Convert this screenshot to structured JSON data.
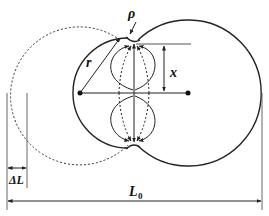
{
  "diagram": {
    "type": "geometric-schematic",
    "labels": {
      "rho": "ρ",
      "r": "r",
      "x": "x",
      "delta_l": "ΔL",
      "l0_main": "L",
      "l0_sub": "0"
    },
    "colors": {
      "stroke": "#222222",
      "background": "#ffffff"
    },
    "elements": {
      "left_circle": {
        "cx": 80,
        "cy": 93,
        "r": 55,
        "style": "solid"
      },
      "right_circle": {
        "cx": 188,
        "cy": 93,
        "r": 73,
        "style": "solid"
      },
      "original_circle": {
        "cx": 76,
        "cy": 93,
        "r": 69,
        "style": "dashed"
      },
      "center_line_y": 93,
      "neck_x": 134,
      "neck_top_y": 40,
      "neck_bottom_y": 148
    }
  }
}
